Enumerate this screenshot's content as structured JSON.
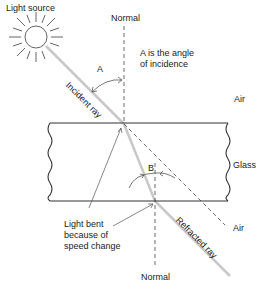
{
  "diagram": {
    "type": "refraction-through-glass-slab",
    "labels": {
      "light_source": "Light source",
      "normal_top": "Normal",
      "normal_bottom": "Normal",
      "angle_a": "A",
      "angle_b": "B",
      "angle_a_desc_line1": "A is the angle",
      "angle_a_desc_line2": "of incidence",
      "air_top": "Air",
      "glass": "Glass",
      "air_bottom": "Air",
      "incident_ray": "Incident ray",
      "refracted_ray": "Refracted ray",
      "bent_line1": "Light bent",
      "bent_line2": "because of",
      "bent_line3": "speed change"
    },
    "colors": {
      "line": "#333333",
      "ray": "#c8c8c8",
      "text": "#222222",
      "background": "#ffffff"
    }
  }
}
